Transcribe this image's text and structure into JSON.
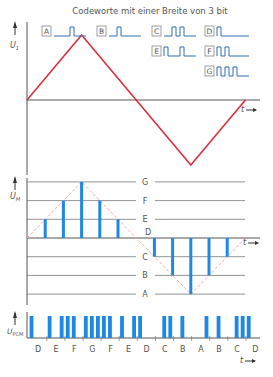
{
  "title": "Codeworte mit einer Breite von 3 bit",
  "colors": {
    "signal": "#d9303e",
    "sample": "#1e88e5",
    "codeword": "#2f6fb5",
    "axis": "#555555",
    "grid": "#777777",
    "dashed": "#f0a8a0",
    "tick": "#e8a070"
  },
  "axes": {
    "top_ylabel": "U₁",
    "mid_ylabel": "Uₘ",
    "pcm_ylabel": "Uₚᴄₘ",
    "pcm_ylabel_main": "U",
    "pcm_ylabel_sub": "PCM",
    "mid_ylabel_main": "U",
    "mid_ylabel_sub": "M",
    "top_ylabel_main": "U",
    "top_ylabel_sub": "1",
    "time_label": "t"
  },
  "codewords": [
    {
      "letter": "A",
      "bits": "001"
    },
    {
      "letter": "B",
      "bits": "010"
    },
    {
      "letter": "C",
      "bits": "011"
    },
    {
      "letter": "D",
      "bits": "100"
    },
    {
      "letter": "E",
      "bits": "101"
    },
    {
      "letter": "F",
      "bits": "110"
    },
    {
      "letter": "G",
      "bits": "111"
    }
  ],
  "levels": [
    "G",
    "F",
    "E",
    "D",
    "C",
    "B",
    "A"
  ],
  "chart_data": {
    "type": "diagram",
    "title": "Codeworte mit einer Breite von 3 bit",
    "signal": {
      "type": "triangle",
      "description": "analog input U1",
      "points_t": [
        0,
        3,
        9,
        12
      ],
      "points_v": [
        0,
        3,
        -3,
        0
      ]
    },
    "samples": {
      "t": [
        1,
        2,
        3,
        4,
        5,
        7,
        8,
        9,
        10,
        11
      ],
      "levels": [
        "E",
        "F",
        "G",
        "F",
        "E",
        "C",
        "B",
        "A",
        "B",
        "C"
      ]
    },
    "pcm_sequence": [
      "D",
      "E",
      "F",
      "G",
      "F",
      "E",
      "D",
      "C",
      "B",
      "A",
      "B",
      "C",
      "D"
    ]
  }
}
